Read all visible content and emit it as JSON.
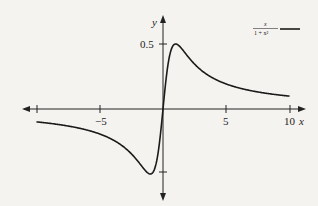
{
  "chart_data": {
    "type": "line",
    "title": "",
    "xlabel": "x",
    "ylabel": "y",
    "xlim": [
      -10,
      10
    ],
    "ylim": [
      -0.5,
      0.5
    ],
    "x_ticks": [
      -10,
      -5,
      0,
      5,
      10
    ],
    "x_tick_labels": [
      "",
      "-5",
      "",
      "5",
      "10"
    ],
    "y_ticks": [
      0.5,
      -0.5
    ],
    "y_tick_labels": [
      "0.5",
      ""
    ],
    "grid": false,
    "legend_position": "top-right",
    "series": [
      {
        "name": "x/(1+x^2)",
        "legend_numerator": "x",
        "legend_denominator": "1 + x²",
        "color": "#1a1a1a",
        "x": [
          -10,
          -8,
          -6,
          -4,
          -3,
          -2,
          -1.5,
          -1,
          -0.5,
          0,
          0.5,
          1,
          1.5,
          2,
          3,
          4,
          6,
          8,
          10
        ],
        "values": [
          -0.099,
          -0.123,
          -0.162,
          -0.235,
          -0.3,
          -0.4,
          -0.462,
          -0.5,
          -0.4,
          0,
          0.4,
          0.5,
          0.462,
          0.4,
          0.3,
          0.235,
          0.162,
          0.123,
          0.099
        ]
      }
    ]
  },
  "labels": {
    "x_axis": "x",
    "y_axis": "y",
    "tick_neg5": "−5",
    "tick_5": "5",
    "tick_10": "10",
    "tick_y05": "0.5",
    "legend_num": "x",
    "legend_den": "1 + x²"
  }
}
